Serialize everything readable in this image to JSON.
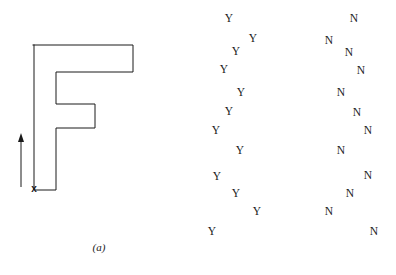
{
  "figure": {
    "width": 396,
    "height": 275,
    "background": "#ffffff",
    "ink": "#1a1a1a"
  },
  "panel_a": {
    "caption": "(a)",
    "shape_name": "F-shaped-polygon",
    "start_marker": {
      "label": "x",
      "x": 34,
      "y": 189
    },
    "direction_arrow": {
      "name": "upward-direction-arrow",
      "x": 21,
      "y_tail": 187,
      "y_head": 133
    },
    "polygon_points": "33,45 133,45 133,72 56,72 56,104 95,104 95,128 56,128 56,190 34,190 34,45",
    "stroke_width": 1
  },
  "panel_b": {
    "caption": "(b)",
    "cluster_y": {
      "name": "y-letter-cluster",
      "letter": "Y",
      "points": [
        {
          "x": 229,
          "y": 19
        },
        {
          "x": 253,
          "y": 39
        },
        {
          "x": 236,
          "y": 52
        },
        {
          "x": 224,
          "y": 70
        },
        {
          "x": 241,
          "y": 93
        },
        {
          "x": 229,
          "y": 112
        },
        {
          "x": 216,
          "y": 131
        },
        {
          "x": 240,
          "y": 151
        },
        {
          "x": 217,
          "y": 177
        },
        {
          "x": 236,
          "y": 194
        },
        {
          "x": 257,
          "y": 212
        },
        {
          "x": 212,
          "y": 232
        }
      ]
    },
    "cluster_n": {
      "name": "n-letter-cluster",
      "letter": "N",
      "points": [
        {
          "x": 354,
          "y": 19
        },
        {
          "x": 329,
          "y": 41
        },
        {
          "x": 349,
          "y": 53
        },
        {
          "x": 361,
          "y": 71
        },
        {
          "x": 341,
          "y": 93
        },
        {
          "x": 357,
          "y": 113
        },
        {
          "x": 368,
          "y": 131
        },
        {
          "x": 341,
          "y": 151
        },
        {
          "x": 368,
          "y": 176
        },
        {
          "x": 350,
          "y": 194
        },
        {
          "x": 329,
          "y": 212
        },
        {
          "x": 374,
          "y": 232
        }
      ]
    }
  }
}
